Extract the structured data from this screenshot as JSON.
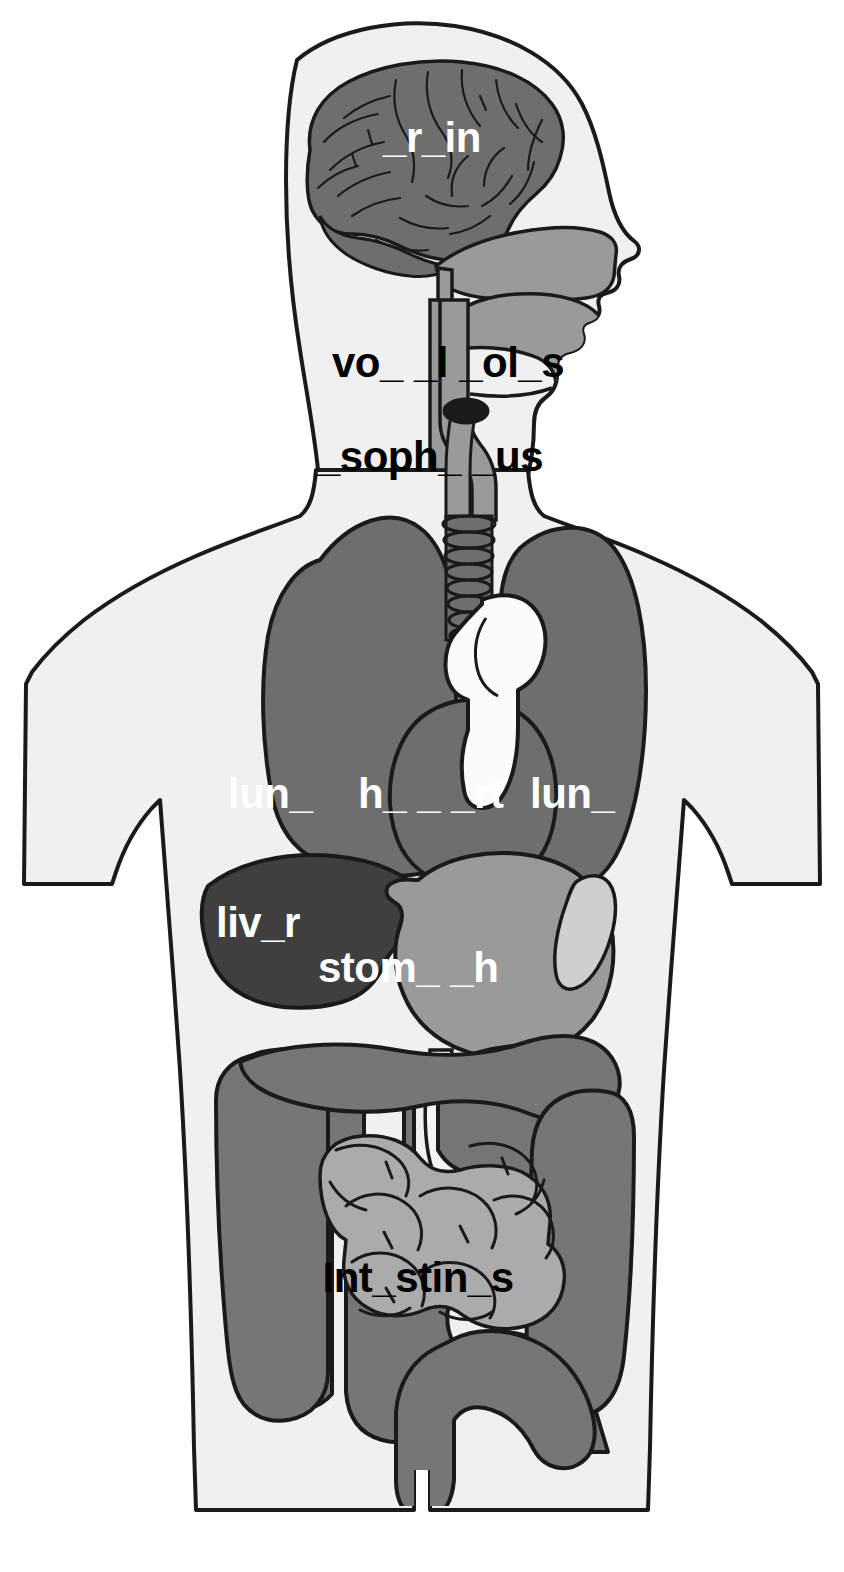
{
  "figure": {
    "kind": "anatomical-diagram",
    "view": "anterior-with-head-profile",
    "background_color": "#ffffff",
    "body_fill_color": "#f0f0f0",
    "outline_color": "#1a1a1a"
  },
  "palette": {
    "brain": "#6e6e6e",
    "nasal_cavity": "#9a9a9a",
    "tongue": "#9a9a9a",
    "pharynx": "#9a9a9a",
    "vocal_folds": "#1a1a1a",
    "trachea": "#6e6e6e",
    "lung": "#6e6e6e",
    "heart": "#6e6e6e",
    "aorta": "#fbfbfb",
    "liver": "#3f3f3f",
    "stomach": "#9a9a9a",
    "spleen": "#cfcfcf",
    "large_intestine": "#767676",
    "small_intestine": "#ababab",
    "label_light": "#ffffff",
    "label_dark": "#000000"
  },
  "labels": [
    {
      "id": "brain",
      "text": "_r_in",
      "color": "#ffffff",
      "x": 432,
      "y": 152,
      "font_size": 42,
      "anchor": "middle"
    },
    {
      "id": "vocal-folds",
      "text": "vo_ _l _ol_s",
      "color": "#000000",
      "x": 448,
      "y": 377,
      "font_size": 42,
      "anchor": "middle"
    },
    {
      "id": "esophagus",
      "text": "_soph_ _us",
      "color": "#000000",
      "x": 430,
      "y": 471,
      "font_size": 42,
      "anchor": "middle"
    },
    {
      "id": "lung-left",
      "text": "lun_",
      "color": "#ffffff",
      "x": 228,
      "y": 808,
      "font_size": 42,
      "anchor": "start"
    },
    {
      "id": "heart",
      "text": "h_ _ _rt",
      "color": "#ffffff",
      "x": 358,
      "y": 808,
      "font_size": 42,
      "anchor": "start"
    },
    {
      "id": "lung-right",
      "text": "lun_",
      "color": "#ffffff",
      "x": 530,
      "y": 808,
      "font_size": 42,
      "anchor": "start"
    },
    {
      "id": "liver",
      "text": "liv_r",
      "color": "#ffffff",
      "x": 216,
      "y": 937,
      "font_size": 42,
      "anchor": "start"
    },
    {
      "id": "stomach",
      "text": "stom_ _h",
      "color": "#ffffff",
      "x": 318,
      "y": 982,
      "font_size": 42,
      "anchor": "start"
    },
    {
      "id": "intestines",
      "text": "Int_stin_s",
      "color": "#000000",
      "x": 418,
      "y": 1292,
      "font_size": 42,
      "anchor": "middle"
    }
  ],
  "organs": [
    {
      "id": "brain",
      "name": "brain",
      "label_ref": "brain"
    },
    {
      "id": "nasal-cavity",
      "name": "nasal cavity",
      "label_ref": null
    },
    {
      "id": "tongue",
      "name": "tongue",
      "label_ref": null
    },
    {
      "id": "pharynx",
      "name": "pharynx",
      "label_ref": null
    },
    {
      "id": "vocal-folds",
      "name": "vocal folds",
      "label_ref": "vocal-folds"
    },
    {
      "id": "esophagus",
      "name": "esophagus",
      "label_ref": "esophagus"
    },
    {
      "id": "trachea",
      "name": "trachea",
      "label_ref": null
    },
    {
      "id": "lung-left",
      "name": "lung",
      "label_ref": "lung-left"
    },
    {
      "id": "lung-right",
      "name": "lung",
      "label_ref": "lung-right"
    },
    {
      "id": "heart",
      "name": "heart",
      "label_ref": "heart"
    },
    {
      "id": "aorta",
      "name": "aorta",
      "label_ref": null
    },
    {
      "id": "liver",
      "name": "liver",
      "label_ref": "liver"
    },
    {
      "id": "stomach",
      "name": "stomach",
      "label_ref": "stomach"
    },
    {
      "id": "spleen",
      "name": "spleen",
      "label_ref": null
    },
    {
      "id": "large-intestine",
      "name": "large intestine",
      "label_ref": "intestines"
    },
    {
      "id": "small-intestine",
      "name": "small intestine",
      "label_ref": "intestines"
    }
  ]
}
